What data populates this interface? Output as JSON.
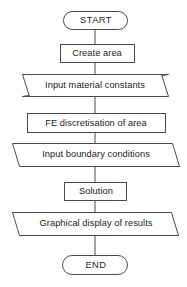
{
  "diagram": {
    "background_color": "#ffffff",
    "stroke_color": "#4a4a4a",
    "text_color": "#1d1d1d",
    "nodes": [
      {
        "id": "start",
        "label": "START",
        "shape": "terminator",
        "x": 63,
        "y": 11,
        "width": 65,
        "height": 19
      },
      {
        "id": "create-area",
        "label": "Create area",
        "shape": "process",
        "x": 60,
        "y": 44,
        "width": 75,
        "height": 19
      },
      {
        "id": "input-material-constants",
        "label": "Input material constants",
        "shape": "data",
        "x": 22,
        "y": 74,
        "width": 147,
        "height": 23
      },
      {
        "id": "fe-discretisation",
        "label": "FE discretisation of area",
        "shape": "process",
        "x": 27,
        "y": 113,
        "width": 139,
        "height": 20
      },
      {
        "id": "input-boundary-conditions",
        "label": "Input boundary conditions",
        "shape": "data",
        "x": 12,
        "y": 143,
        "width": 168,
        "height": 24
      },
      {
        "id": "solution",
        "label": "Solution",
        "shape": "process",
        "x": 64,
        "y": 182,
        "width": 63,
        "height": 19
      },
      {
        "id": "graphical-display",
        "label": "Graphical display of results",
        "shape": "data",
        "x": 12,
        "y": 212,
        "width": 167,
        "height": 24
      },
      {
        "id": "end",
        "label": "END",
        "shape": "terminator",
        "x": 62,
        "y": 255,
        "width": 66,
        "height": 20
      }
    ],
    "connectors": [
      {
        "id": "start-to-create-area",
        "from": "start",
        "to": "create-area",
        "x": 95,
        "y1": 30,
        "y2": 44
      },
      {
        "id": "create-area-to-input-material",
        "from": "create-area",
        "to": "input-material-constants",
        "x": 95,
        "y1": 63,
        "y2": 74
      },
      {
        "id": "input-material-to-fe",
        "from": "input-material-constants",
        "to": "fe-discretisation",
        "x": 95,
        "y1": 97,
        "y2": 113
      },
      {
        "id": "fe-to-input-boundary",
        "from": "fe-discretisation",
        "to": "input-boundary-conditions",
        "x": 95,
        "y1": 133,
        "y2": 143
      },
      {
        "id": "input-boundary-to-solution",
        "from": "input-boundary-conditions",
        "to": "solution",
        "x": 95,
        "y1": 167,
        "y2": 182
      },
      {
        "id": "solution-to-graphical-display",
        "from": "solution",
        "to": "graphical-display",
        "x": 95,
        "y1": 201,
        "y2": 212
      },
      {
        "id": "graphical-display-to-end",
        "from": "graphical-display",
        "to": "end",
        "x": 95,
        "y1": 236,
        "y2": 255
      }
    ]
  }
}
